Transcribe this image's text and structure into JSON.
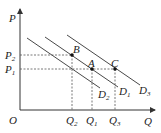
{
  "diagram": {
    "axes": {
      "y_label": "P",
      "x_label": "Q",
      "origin_label": "O"
    },
    "price_levels": [
      {
        "id": "P2",
        "base": "P",
        "sub": "2"
      },
      {
        "id": "P1",
        "base": "P",
        "sub": "1"
      }
    ],
    "quantity_levels": [
      {
        "id": "Q2",
        "base": "Q",
        "sub": "2"
      },
      {
        "id": "Q1",
        "base": "Q",
        "sub": "1"
      },
      {
        "id": "Q3",
        "base": "Q",
        "sub": "3"
      }
    ],
    "demand_curves": [
      {
        "id": "D2",
        "base": "D",
        "sub": "2"
      },
      {
        "id": "D1",
        "base": "D",
        "sub": "1"
      },
      {
        "id": "D3",
        "base": "D",
        "sub": "3"
      }
    ],
    "points": [
      {
        "label": "B",
        "price": "P2",
        "quantity": "Q2",
        "curve": "D1"
      },
      {
        "label": "A",
        "price": "P1",
        "quantity": "Q1",
        "curve": "D1"
      },
      {
        "label": "C",
        "price": "P1",
        "quantity": "Q3",
        "curve": "D3"
      }
    ]
  }
}
